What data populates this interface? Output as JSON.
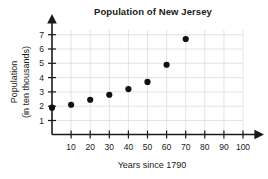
{
  "chart_data": {
    "type": "scatter",
    "title": "Population of New Jersey",
    "xlabel": "Years since 1790",
    "ylabel_line1": "Population",
    "ylabel_line2": "(in ten thousands)",
    "x": [
      0,
      10,
      20,
      30,
      40,
      50,
      60,
      70
    ],
    "values": [
      1.9,
      2.1,
      2.45,
      2.8,
      3.2,
      3.7,
      4.9,
      6.7
    ],
    "points": [
      {
        "x": 0,
        "y": 1.9
      },
      {
        "x": 10,
        "y": 2.1
      },
      {
        "x": 20,
        "y": 2.45
      },
      {
        "x": 30,
        "y": 2.8
      },
      {
        "x": 40,
        "y": 3.2
      },
      {
        "x": 50,
        "y": 3.7
      },
      {
        "x": 60,
        "y": 4.9
      },
      {
        "x": 70,
        "y": 6.7
      }
    ],
    "xticks": [
      10,
      20,
      30,
      40,
      50,
      60,
      70,
      80,
      90,
      100
    ],
    "yticks": [
      1,
      2,
      3,
      4,
      5,
      6,
      7
    ],
    "xlim": [
      0,
      105
    ],
    "ylim": [
      0,
      7.35
    ],
    "grid": true,
    "legend": null,
    "marker_color": "#111111",
    "grid_color": "#d8d8d8",
    "axis_color": "#1a1a1a"
  }
}
